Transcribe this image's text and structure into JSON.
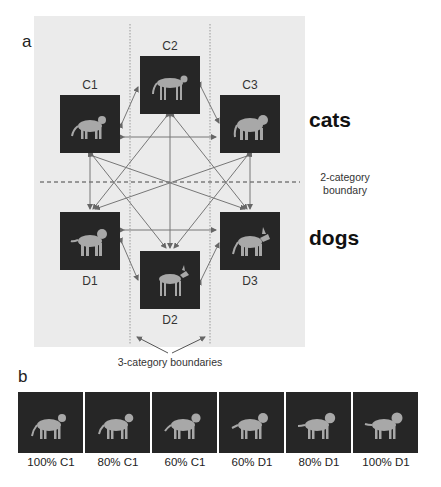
{
  "panel_a": {
    "letter": "a",
    "stimuli": [
      {
        "id": "C1",
        "label": "C1",
        "animal": "cat",
        "category": "cats"
      },
      {
        "id": "C2",
        "label": "C2",
        "animal": "cheetah",
        "category": "cats"
      },
      {
        "id": "C3",
        "label": "C3",
        "animal": "tiger",
        "category": "cats"
      },
      {
        "id": "D1",
        "label": "D1",
        "animal": "dog",
        "category": "dogs"
      },
      {
        "id": "D2",
        "label": "D2",
        "animal": "doberman",
        "category": "dogs"
      },
      {
        "id": "D3",
        "label": "D3",
        "animal": "shepherd",
        "category": "dogs"
      }
    ],
    "category_labels": {
      "top": "cats",
      "bottom": "dogs"
    },
    "two_category_boundary": {
      "line1": "2-category",
      "line2": "boundary"
    },
    "three_category_boundaries": "3-category boundaries",
    "colors": {
      "panel_bg": "#ebebeb",
      "tile_bg": "#262626",
      "arrow": "#777777"
    }
  },
  "panel_b": {
    "letter": "b",
    "morph_series": [
      {
        "label": "100% C1"
      },
      {
        "label": "80% C1"
      },
      {
        "label": "60% C1"
      },
      {
        "label": "60% D1"
      },
      {
        "label": "80% D1"
      },
      {
        "label": "100% D1"
      }
    ]
  }
}
